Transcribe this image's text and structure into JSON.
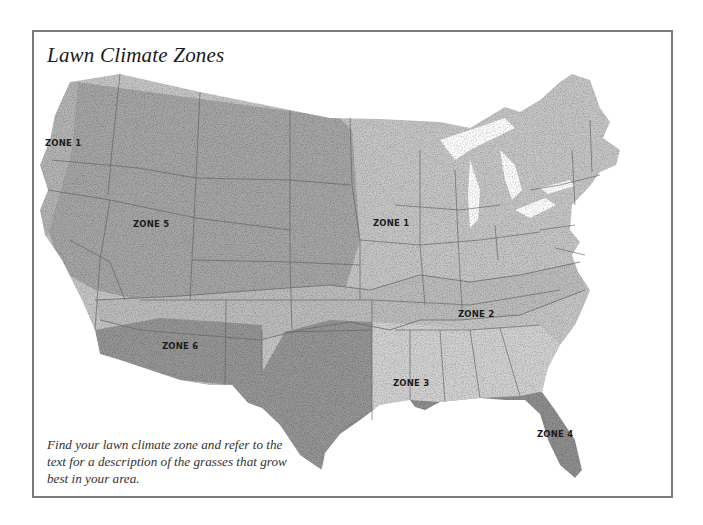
{
  "map": {
    "title": "Lawn Climate Zones",
    "caption": "Find your lawn climate zone and refer to the text for a description of the grasses that grow best in your area.",
    "zones": [
      {
        "id": "zone-1-west",
        "label": "ZONE 1",
        "x": 45,
        "y": 142
      },
      {
        "id": "zone-1-midwest",
        "label": "ZONE 1",
        "x": 373,
        "y": 220
      },
      {
        "id": "zone-5",
        "label": "ZONE 5",
        "x": 133,
        "y": 222
      },
      {
        "id": "zone-2",
        "label": "ZONE 2",
        "x": 458,
        "y": 312
      },
      {
        "id": "zone-6",
        "label": "ZONE 6",
        "x": 162,
        "y": 344
      },
      {
        "id": "zone-3",
        "label": "ZONE 3",
        "x": 393,
        "y": 381
      },
      {
        "id": "zone-4",
        "label": "ZONE 4",
        "x": 537,
        "y": 432
      }
    ],
    "colors": {
      "frame_border": "#7a7a7a",
      "zone_light": "#c9c9c9",
      "zone_medium": "#a9a9a9",
      "zone_dark": "#8e8e8e",
      "state_border": "#555555"
    }
  }
}
